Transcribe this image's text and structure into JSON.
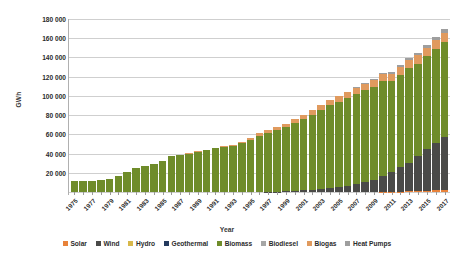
{
  "chart_data": {
    "type": "bar",
    "stacked": true,
    "title": "",
    "xlabel": "Year",
    "ylabel": "GWh",
    "ylim": [
      0,
      180000
    ],
    "ytick_step": 20000,
    "ytick_labels": [
      "180 000",
      "160 000",
      "140 000",
      "120 000",
      "100 000",
      "80 000",
      "60 000",
      "40 000",
      "20 000"
    ],
    "ytick_values": [
      180000,
      160000,
      140000,
      120000,
      100000,
      80000,
      60000,
      40000,
      20000
    ],
    "grid": true,
    "legend_position": "bottom",
    "x": [
      1975,
      1976,
      1977,
      1978,
      1979,
      1980,
      1981,
      1982,
      1983,
      1984,
      1985,
      1986,
      1987,
      1988,
      1989,
      1990,
      1991,
      1992,
      1993,
      1994,
      1995,
      1996,
      1997,
      1998,
      1999,
      2000,
      2001,
      2002,
      2003,
      2004,
      2005,
      2006,
      2007,
      2008,
      2009,
      2010,
      2011,
      2012,
      2013,
      2014,
      2015,
      2016,
      2017
    ],
    "xtick_labels": [
      "1975",
      "1977",
      "1979",
      "1981",
      "1983",
      "1985",
      "1987",
      "1989",
      "1991",
      "1993",
      "1995",
      "1997",
      "1999",
      "2001",
      "2003",
      "2005",
      "2007",
      "2009",
      "2011",
      "2013",
      "2015",
      "2017"
    ],
    "xtick_label_interval": 2,
    "series": [
      {
        "name": "Solar",
        "color": "#E8823A",
        "values": [
          0,
          0,
          0,
          0,
          0,
          0,
          0,
          0,
          0,
          0,
          0,
          0,
          0,
          0,
          0,
          0,
          0,
          0,
          0,
          0,
          0,
          0,
          0,
          0,
          0,
          0,
          0,
          0,
          0,
          0,
          0,
          0,
          0,
          0,
          0,
          100,
          200,
          400,
          700,
          1000,
          1300,
          1600,
          2000
        ]
      },
      {
        "name": "Wind",
        "color": "#4A4A48",
        "values": [
          0,
          0,
          0,
          0,
          0,
          0,
          0,
          0,
          0,
          0,
          0,
          0,
          0,
          0,
          0,
          0,
          0,
          0,
          0,
          0,
          0,
          0,
          200,
          400,
          700,
          1100,
          1600,
          2200,
          3000,
          4000,
          5200,
          6600,
          8300,
          10500,
          13000,
          16000,
          20000,
          25000,
          30000,
          36000,
          43000,
          49000,
          55000
        ]
      },
      {
        "name": "Hydro",
        "color": "#D8B84A",
        "values": [
          0,
          0,
          0,
          0,
          0,
          0,
          0,
          0,
          0,
          0,
          0,
          0,
          0,
          0,
          0,
          0,
          0,
          0,
          0,
          0,
          0,
          0,
          0,
          0,
          0,
          0,
          0,
          0,
          0,
          0,
          0,
          0,
          0,
          0,
          0,
          0,
          0,
          0,
          0,
          0,
          0,
          0,
          0
        ]
      },
      {
        "name": "Geothermal",
        "color": "#243A5E",
        "values": [
          0,
          0,
          0,
          0,
          0,
          0,
          0,
          0,
          0,
          0,
          0,
          0,
          0,
          0,
          0,
          0,
          0,
          0,
          0,
          0,
          0,
          0,
          0,
          0,
          0,
          0,
          0,
          0,
          0,
          0,
          0,
          0,
          0,
          0,
          0,
          0,
          0,
          0,
          0,
          0,
          0,
          0,
          0
        ]
      },
      {
        "name": "Biomass",
        "color": "#6F8C2A",
        "values": [
          11000,
          11200,
          11500,
          12000,
          13500,
          16500,
          20500,
          25500,
          27500,
          29500,
          32500,
          37000,
          39000,
          40000,
          42000,
          43500,
          45500,
          46500,
          48000,
          50500,
          54500,
          58500,
          61000,
          63500,
          66500,
          70500,
          74500,
          78000,
          82500,
          86500,
          88500,
          91000,
          93500,
          95500,
          96500,
          98500,
          95000,
          96500,
          98000,
          96500,
          97000,
          98500,
          99500
        ]
      },
      {
        "name": "Biodiesel",
        "color": "#A6A6A6",
        "values": [
          0,
          0,
          0,
          0,
          0,
          0,
          0,
          0,
          0,
          0,
          0,
          0,
          0,
          0,
          0,
          0,
          0,
          0,
          0,
          0,
          0,
          0,
          0,
          0,
          0,
          0,
          0,
          0,
          0,
          0,
          0,
          0,
          0,
          0,
          0,
          0,
          0,
          0,
          0,
          0,
          0,
          0,
          0
        ]
      },
      {
        "name": "Biogas",
        "color": "#E09A5E",
        "values": [
          0,
          0,
          0,
          0,
          0,
          0,
          0,
          0,
          0,
          0,
          0,
          0,
          0,
          200,
          400,
          600,
          800,
          1000,
          1300,
          1600,
          2000,
          2400,
          2800,
          3200,
          3600,
          4000,
          4400,
          4800,
          5200,
          5600,
          6000,
          6300,
          6600,
          6900,
          7200,
          7500,
          7800,
          8100,
          8400,
          8600,
          8800,
          9000,
          9200
        ]
      },
      {
        "name": "Heat Pumps",
        "color": "#9E9E9E",
        "values": [
          0,
          0,
          0,
          0,
          0,
          0,
          0,
          0,
          0,
          0,
          0,
          0,
          0,
          0,
          0,
          0,
          0,
          0,
          0,
          0,
          0,
          0,
          0,
          0,
          0,
          0,
          0,
          0,
          0,
          0,
          0,
          0,
          200,
          400,
          700,
          1000,
          1400,
          1800,
          2200,
          2600,
          3000,
          3400,
          3800
        ]
      }
    ]
  }
}
